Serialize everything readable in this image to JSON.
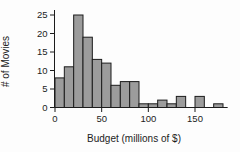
{
  "figure": {
    "background": "#fdfdfd"
  },
  "chart_data": {
    "type": "bar",
    "subtype": "histogram",
    "title": "",
    "xlabel": "Budget (millions of $)",
    "ylabel": "# of Movies",
    "bin_width": 10,
    "bin_edges": [
      0,
      10,
      20,
      30,
      40,
      50,
      60,
      70,
      80,
      90,
      100,
      110,
      120,
      130,
      140,
      150,
      160,
      170,
      180
    ],
    "counts": [
      8,
      11,
      25,
      19,
      13,
      12,
      6,
      7,
      7,
      1,
      1,
      2,
      1,
      3,
      0,
      3,
      0,
      1
    ],
    "x_ticks": [
      0,
      50,
      100,
      150
    ],
    "y_ticks": [
      0,
      5,
      10,
      15,
      20,
      25
    ],
    "xlim": [
      0,
      185
    ],
    "ylim": [
      0,
      25
    ],
    "grid": false,
    "legend": false,
    "bar_fill": "#9c9c9c",
    "bar_stroke": "#1c1c1c",
    "axis_color": "#1c1c1c"
  }
}
